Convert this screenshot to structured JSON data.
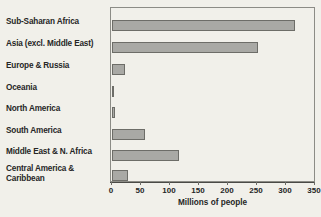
{
  "chart_data": {
    "type": "bar",
    "orientation": "horizontal",
    "title": "",
    "xlabel": "Millions of people",
    "ylabel": "",
    "xlim": [
      0,
      350
    ],
    "xticks": [
      0,
      50,
      100,
      150,
      200,
      250,
      300,
      350
    ],
    "grid": false,
    "legend": null,
    "categories": [
      "Sub-Saharan Africa",
      "Asia (excl. Middle East)",
      "Europe & Russia",
      "Oceania",
      "North America",
      "South America",
      "Middle East & N. Africa",
      "Central America &\nCaribbean"
    ],
    "values": [
      315,
      251,
      22,
      3,
      6,
      57,
      115,
      28
    ],
    "bar_color": "#a9a9a5",
    "bar_edge_color": "#6d6d68",
    "background_color": "#f1f0ea",
    "frame_color": "#8c8c86"
  }
}
